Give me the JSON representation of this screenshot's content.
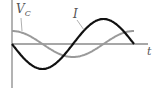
{
  "diagram": {
    "type": "phase-plot",
    "axes": {
      "horizontal_label": "t",
      "vertical_label": ""
    },
    "curves": [
      {
        "name": "I",
        "label": "I",
        "color": "#111111",
        "description": "current, starts at zero going negative (−sin)",
        "amplitude_px": 25,
        "period_px": 122,
        "phase": "-sin"
      },
      {
        "name": "V_C",
        "label_main": "V",
        "label_sub": "C",
        "color": "#9a9a9a",
        "description": "capacitor voltage, starts at maximum (cos)",
        "amplitude_px": 13,
        "period_px": 122,
        "phase": "cos"
      }
    ],
    "colors": {
      "axis": "#8a8a8a",
      "label": "#555555",
      "background": "#ffffff"
    }
  }
}
